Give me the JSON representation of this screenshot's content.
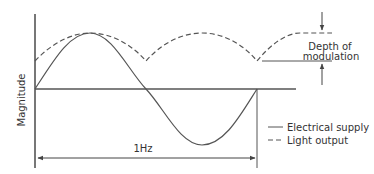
{
  "diagram": {
    "y_axis_label": "Magnitude",
    "period_label": "1Hz",
    "depth_label_line1": "Depth of",
    "depth_label_line2": "modulation",
    "legend": [
      {
        "style": "solid",
        "label": "Electrical supply"
      },
      {
        "style": "dashed",
        "label": "Light output"
      }
    ],
    "colors": {
      "line": "#555555",
      "text": "#333333"
    }
  }
}
